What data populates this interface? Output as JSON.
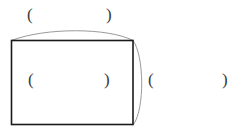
{
  "figure": {
    "background_color": "#ffffff",
    "width": 241,
    "height": 132,
    "shape": {
      "name": "rectangle-with-arc",
      "rect_stroke_color": "#1a1a1a",
      "rect_stroke_width": 1.6,
      "arc_stroke_color": "#9a9a9a",
      "arc_stroke_width": 1,
      "fill": "none"
    }
  },
  "labels": {
    "top_left": "(",
    "top_right": ")",
    "inner_left": "(",
    "inner_right": ")",
    "outer_left": "(",
    "outer_right": ")"
  }
}
